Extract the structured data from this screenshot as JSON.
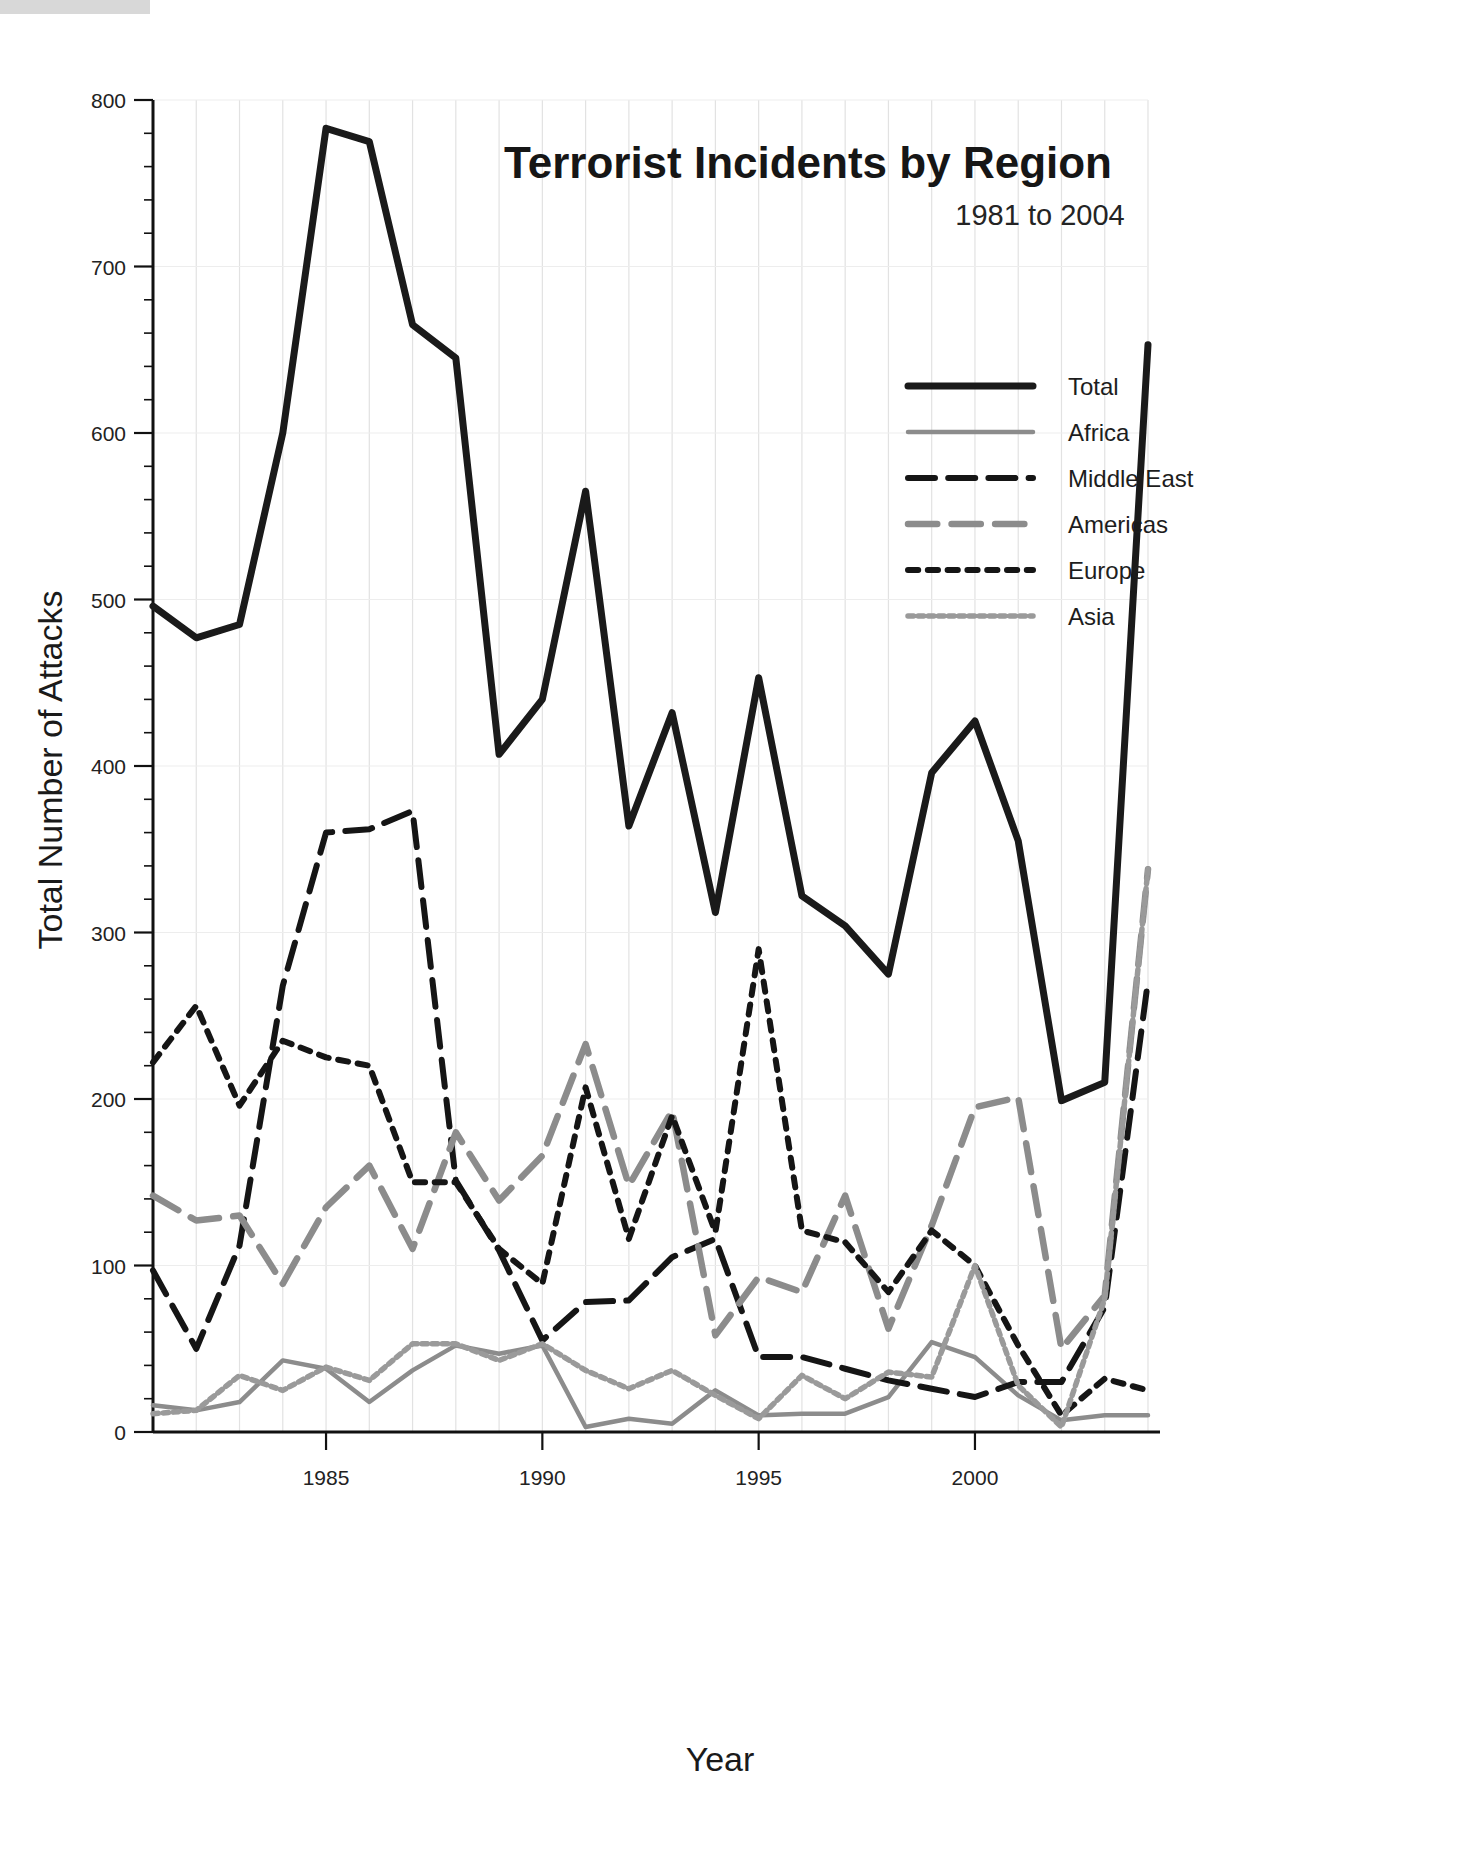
{
  "chart_data": {
    "type": "line",
    "title": "Terrorist Incidents by Region",
    "subtitle": "1981 to 2004",
    "xlabel": "Year",
    "ylabel": "Total Number of Attacks",
    "grid": true,
    "legend_position": "upper-right",
    "xlim": [
      1981,
      2004
    ],
    "ylim": [
      0,
      800
    ],
    "ytick_labels": [
      "0",
      "100",
      "200",
      "300",
      "400",
      "500",
      "600",
      "700",
      "800"
    ],
    "ytick_values": [
      0,
      100,
      200,
      300,
      400,
      500,
      600,
      700,
      800
    ],
    "ytick_minor_step": 20,
    "xtick_labels": [
      "1985",
      "1990",
      "1995",
      "2000"
    ],
    "xtick_values": [
      1985,
      1990,
      1995,
      2000
    ],
    "x": [
      1981,
      1982,
      1983,
      1984,
      1985,
      1986,
      1987,
      1988,
      1989,
      1990,
      1991,
      1992,
      1993,
      1994,
      1995,
      1996,
      1997,
      1998,
      1999,
      2000,
      2001,
      2002,
      2003,
      2004
    ],
    "series": [
      {
        "name": "Total",
        "style": "solid",
        "color": "#1a1a1a",
        "width": 7,
        "values": [
          496,
          477,
          485,
          600,
          783,
          775,
          665,
          645,
          407,
          440,
          565,
          364,
          432,
          312,
          453,
          322,
          304,
          275,
          396,
          427,
          355,
          199,
          210,
          653
        ]
      },
      {
        "name": "Africa",
        "style": "solid",
        "color": "#8c8c8c",
        "width": 4.5,
        "values": [
          16,
          13,
          18,
          43,
          38,
          18,
          37,
          52,
          47,
          52,
          3,
          8,
          5,
          25,
          10,
          11,
          11,
          21,
          54,
          45,
          22,
          7,
          10,
          10
        ]
      },
      {
        "name": "Middle East",
        "style": "dash",
        "color": "#151515",
        "width": 6,
        "values": [
          97,
          50,
          112,
          268,
          360,
          362,
          373,
          151,
          109,
          55,
          78,
          79,
          105,
          116,
          45,
          45,
          38,
          31,
          26,
          21,
          30,
          30,
          75,
          271
        ]
      },
      {
        "name": "Americas",
        "style": "dash",
        "color": "#8c8c8c",
        "width": 6.5,
        "values": [
          142,
          127,
          130,
          89,
          135,
          160,
          110,
          180,
          139,
          166,
          233,
          148,
          193,
          58,
          93,
          84,
          142,
          62,
          124,
          195,
          201,
          50,
          82,
          338
        ]
      },
      {
        "name": "Europe",
        "style": "dot",
        "color": "#151515",
        "width": 6,
        "values": [
          222,
          256,
          196,
          235,
          225,
          220,
          150,
          150,
          110,
          89,
          207,
          116,
          190,
          120,
          290,
          121,
          114,
          84,
          121,
          100,
          52,
          10,
          32,
          25
        ]
      },
      {
        "name": "Asia",
        "style": "finedot",
        "color": "#9a9a9a",
        "width": 5.5,
        "values": [
          11,
          13,
          34,
          25,
          39,
          31,
          53,
          53,
          43,
          53,
          37,
          26,
          37,
          22,
          8,
          34,
          20,
          36,
          33,
          100,
          28,
          3,
          80,
          338
        ]
      }
    ]
  },
  "legend": {
    "items": [
      {
        "label": "Total"
      },
      {
        "label": "Africa"
      },
      {
        "label": "Middle East"
      },
      {
        "label": "Americas"
      },
      {
        "label": "Europe"
      },
      {
        "label": "Asia"
      }
    ]
  }
}
